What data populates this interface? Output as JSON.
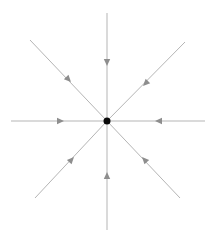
{
  "figure": {
    "type": "phase-portrait"
  },
  "diagram": {
    "width": 215,
    "height": 244,
    "background": "#ffffff",
    "line_color": "#b5b5b5",
    "line_width": 1,
    "arrow_color": "#8e8e8e",
    "arrow_length": 7,
    "arrow_half_width": 3.2,
    "center": {
      "x": 107,
      "y": 121,
      "radius": 3.5,
      "color": "#0a0a0a"
    },
    "rays": [
      {
        "name": "ray-up",
        "end": [
          107,
          13
        ],
        "arrow_apex": [
          107,
          66
        ]
      },
      {
        "name": "ray-down",
        "end": [
          107,
          230
        ],
        "arrow_apex": [
          107,
          172
        ]
      },
      {
        "name": "ray-left",
        "end": [
          11,
          121
        ],
        "arrow_apex": [
          64,
          121
        ]
      },
      {
        "name": "ray-right",
        "end": [
          205,
          121
        ],
        "arrow_apex": [
          155,
          121
        ]
      },
      {
        "name": "ray-up-left",
        "end": [
          30,
          40
        ],
        "arrow_apex": [
          71,
          82
        ]
      },
      {
        "name": "ray-up-right",
        "end": [
          185,
          42
        ],
        "arrow_apex": [
          143,
          86
        ]
      },
      {
        "name": "ray-down-left",
        "end": [
          35,
          198
        ],
        "arrow_apex": [
          74,
          157
        ]
      },
      {
        "name": "ray-down-right",
        "end": [
          180,
          198
        ],
        "arrow_apex": [
          142,
          157
        ]
      }
    ]
  }
}
